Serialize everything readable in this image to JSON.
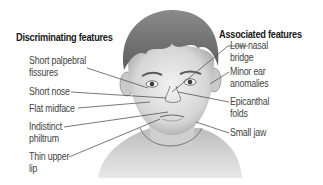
{
  "diagram": {
    "left_group": {
      "heading": "Discriminating features",
      "items": [
        {
          "line1": "Short palpebral",
          "line2": "fissures"
        },
        {
          "line1": "Short nose",
          "line2": ""
        },
        {
          "line1": "Flat midface",
          "line2": ""
        },
        {
          "line1": "Indistinct",
          "line2": "philtrum"
        },
        {
          "line1": "Thin upper",
          "line2": "lip"
        }
      ]
    },
    "right_group": {
      "heading": "Associated features",
      "items": [
        {
          "line1": "Low nasal",
          "line2": "bridge"
        },
        {
          "line1": "Minor ear",
          "line2": "anomalies"
        },
        {
          "line1": "Epicanthal",
          "line2": "folds"
        },
        {
          "line1": "Small jaw",
          "line2": ""
        }
      ]
    },
    "illustration": "child-face-illustration",
    "colors": {
      "text": "#444444",
      "heading": "#1a1a1a",
      "leader_line": "#555555",
      "hair": "#6e6e6e",
      "skin": "#d9d9d9"
    }
  }
}
